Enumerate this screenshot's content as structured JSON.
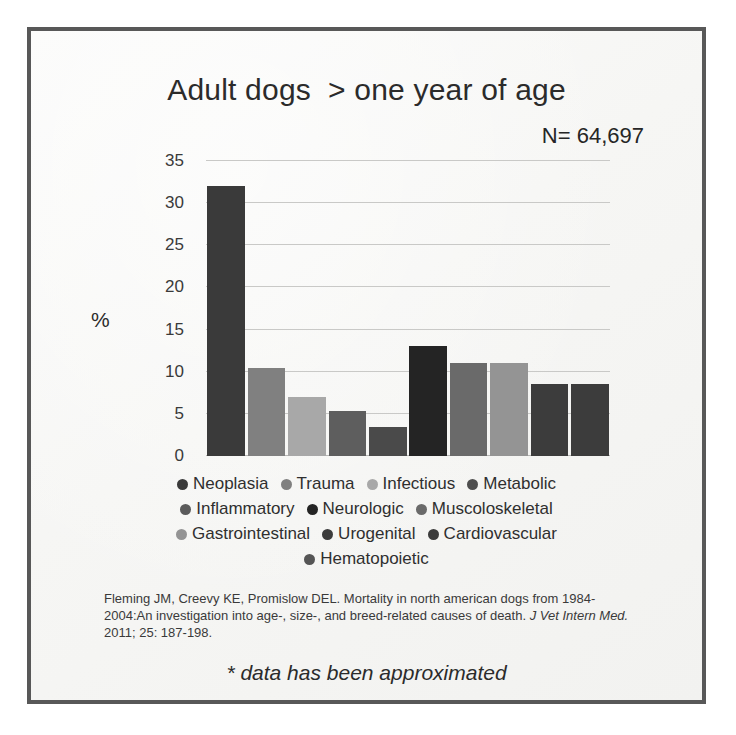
{
  "slide": {
    "border_color": "#585858",
    "background_color": "#f7f7f5"
  },
  "header": {
    "title": "Adult dogs  > one year of age",
    "sample_size": "N= 64,697"
  },
  "citation": {
    "line1": "Fleming JM, Creevy KE, Promislow DEL. Mortality in north american dogs from",
    "line2": "1984-2004:An investigation into age-, size-, and breed-related causes of death.",
    "journal_abbrev_start": "J",
    "journal_abbrev_rest": "Vet Intern Med.",
    "line3_tail": " 2011; 25: 187-198."
  },
  "footnote": "* data has been approximated",
  "legend": {
    "rows": [
      [
        {
          "label": "Neoplasia",
          "color": "#3a3a3a"
        },
        {
          "label": "Trauma",
          "color": "#808080"
        },
        {
          "label": "Infectious",
          "color": "#a8a8a8"
        },
        {
          "label": "Metabolic",
          "color": "#4e4e4e"
        }
      ],
      [
        {
          "label": "Inflammatory",
          "color": "#5b5b5b"
        },
        {
          "label": "Neurologic",
          "color": "#242424"
        },
        {
          "label": "Muscoloskeletal",
          "color": "#6a6a6a"
        }
      ],
      [
        {
          "label": "Gastrointestinal",
          "color": "#949494"
        },
        {
          "label": "Urogenital",
          "color": "#3c3c3c"
        },
        {
          "label": "Cardiovascular",
          "color": "#3c3c3c"
        }
      ],
      [
        {
          "label": "Hematopoietic",
          "color": "#555555"
        }
      ]
    ]
  },
  "chart_data": {
    "type": "bar",
    "title": "Adult dogs  > one year of age",
    "xlabel": "",
    "ylabel": "%",
    "ylim": [
      0,
      35
    ],
    "yticks": [
      0,
      5,
      10,
      15,
      20,
      25,
      30,
      35
    ],
    "grid": true,
    "legend_position": "below-plot",
    "annotation": "N= 64,697",
    "categories": [
      "Neoplasia",
      "Trauma",
      "Infectious",
      "Metabolic",
      "Inflammatory",
      "Neurologic",
      "Muscoloskeletal",
      "Gastrointestinal",
      "Urogenital",
      "Cardiovascular"
    ],
    "values": [
      32,
      10.4,
      7,
      5.4,
      3.4,
      13,
      11,
      11,
      8.6,
      8.6
    ],
    "colors": [
      "#3a3a3a",
      "#808080",
      "#a8a8a8",
      "#5e5e5e",
      "#4a4a4a",
      "#242424",
      "#6a6a6a",
      "#949494",
      "#3c3c3c",
      "#3c3c3c"
    ]
  }
}
